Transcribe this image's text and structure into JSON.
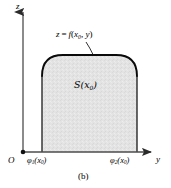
{
  "figure": {
    "caption": "(b)",
    "vertical_axis_label": "z",
    "horizontal_axis_label": "y",
    "origin_label": "O",
    "curve_equation": {
      "lhs": "z",
      "operator": "=",
      "function": "f",
      "arg_base": "x",
      "arg_sub": "0",
      "arg_second": "y",
      "full_text": "z = f(x0, y)"
    },
    "region_label": {
      "symbol": "S",
      "arg_base": "x",
      "arg_sub": "0",
      "full_text": "S(x0)"
    },
    "lower_bound": {
      "symbol": "φ",
      "index": "1",
      "arg_base": "x",
      "arg_sub": "0",
      "full_text": "φ1(x0)"
    },
    "upper_bound": {
      "symbol": "φ",
      "index": "2",
      "arg_base": "x",
      "arg_sub": "0",
      "full_text": "φ2(x0)"
    },
    "colors": {
      "axis": "#4d4d4d",
      "curve": "#000000",
      "region_fill": "#e2e2e2",
      "region_stroke": "#111111",
      "background": "#ffffff",
      "text": "#000000"
    },
    "geometry": {
      "z_axis_x": 23,
      "y_axis_y": 152,
      "region_left_x": 42,
      "region_right_x": 137,
      "region_top_y": 55,
      "corner_radius": 21
    }
  }
}
